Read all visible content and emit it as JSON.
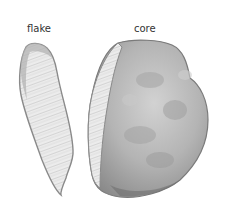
{
  "illustration": {
    "labels": {
      "flake": "flake",
      "core": "core"
    },
    "colors": {
      "background": "#ffffff",
      "label_text": "#333333",
      "flake_fill": "#e8e8e8",
      "flake_edge": "#8a8a8a",
      "core_fill": "#b8b8b8",
      "core_shadow": "#8c8c8c",
      "core_highlight": "#d4d4d4",
      "scar_fill": "#e6e6e6"
    }
  }
}
